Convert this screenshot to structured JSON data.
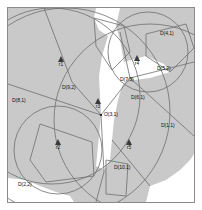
{
  "figure": {
    "frame": {
      "border_color": "#8a8a8a",
      "background": "#ffffff",
      "x": 7,
      "y": 7,
      "width": 188,
      "height": 196
    },
    "fill_color": "#c9c9c9",
    "stroke_color": "#6e6e6e",
    "label_color": "#111111",
    "center_point": {
      "name": "O(3,1)",
      "x": 101,
      "y": 115
    },
    "site_labels": [
      {
        "name": "D(4,1)",
        "x": 160,
        "y": 34
      },
      {
        "name": "D(5,2)",
        "x": 159,
        "y": 69
      },
      {
        "name": "D(7,3)",
        "x": 123,
        "y": 81
      },
      {
        "name": "D(6,1)",
        "x": 134,
        "y": 99
      },
      {
        "name": "D(1,1)",
        "x": 163,
        "y": 126
      },
      {
        "name": "D(9,2)",
        "x": 64,
        "y": 88
      },
      {
        "name": "D(8,1)",
        "x": 14,
        "y": 101
      },
      {
        "name": "D(10,1)",
        "x": 117,
        "y": 168
      },
      {
        "name": "D(2,2)",
        "x": 20,
        "y": 185
      }
    ],
    "region_markers": [
      {
        "name": "r1",
        "x": 61,
        "y": 63
      },
      {
        "name": "r2",
        "x": 58,
        "y": 146
      },
      {
        "name": "r3",
        "x": 98,
        "y": 105
      },
      {
        "name": "r4",
        "x": 137,
        "y": 62
      },
      {
        "name": "r5",
        "x": 129,
        "y": 146
      }
    ]
  }
}
